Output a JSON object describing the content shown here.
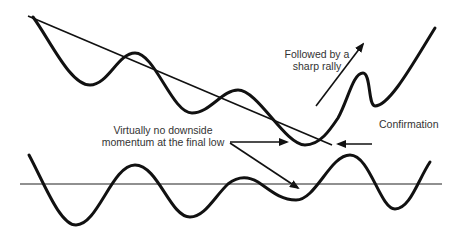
{
  "diagram": {
    "type": "bullish divergence illustration",
    "colors": {
      "line": "#111111",
      "text": "#333333",
      "background": "#ffffff"
    },
    "labels": {
      "rally_line1": "Followed by a",
      "rally_line2": "sharp rally",
      "confirmation": "Confirmation",
      "momentum_line1": "Virtually no downside",
      "momentum_line2": "momentum at the final low"
    },
    "elements": {
      "price_curve": "Price wave with lower highs touching a descending trendline",
      "trendline": "Descending trendline connecting price peaks",
      "oscillator_curve": "Momentum oscillator wave",
      "oscillator_baseline": "Horizontal zero line",
      "arrows": [
        "rally-arrow",
        "confirmation-arrow",
        "final-low-price-arrow",
        "final-low-oscillator-arrow"
      ]
    }
  }
}
